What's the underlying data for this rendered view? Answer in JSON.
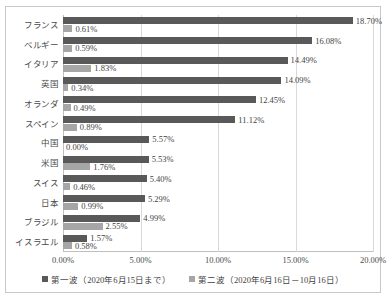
{
  "chart_data": {
    "type": "bar",
    "orientation": "horizontal",
    "title": "",
    "xlabel": "",
    "ylabel": "",
    "xlim": [
      0,
      20
    ],
    "grid": true,
    "legend_position": "bottom",
    "categories": [
      "フランス",
      "ベルギー",
      "イタリア",
      "英国",
      "オランダ",
      "スペイン",
      "中国",
      "米国",
      "スイス",
      "日本",
      "ブラジル",
      "イスラエル"
    ],
    "series": [
      {
        "name": "第一波（2020年6月15日まで）",
        "color": "#595959",
        "values": [
          18.7,
          16.08,
          14.49,
          14.09,
          12.45,
          11.12,
          5.57,
          5.53,
          5.4,
          5.29,
          4.99,
          1.57
        ],
        "labels": [
          "18.70%",
          "16.08%",
          "14.49%",
          "14.09%",
          "12.45%",
          "11.12%",
          "5.57%",
          "5.53%",
          "5.40%",
          "5.29%",
          "4.99%",
          "1.57%"
        ]
      },
      {
        "name": "第二波（2020年6月16日－10月16日）",
        "color": "#a6a6a6",
        "values": [
          0.61,
          0.59,
          1.83,
          0.34,
          0.49,
          0.89,
          0.0,
          1.76,
          0.46,
          0.99,
          2.55,
          0.58
        ],
        "labels": [
          "0.61%",
          "0.59%",
          "1.83%",
          "0.34%",
          "0.49%",
          "0.89%",
          "0.00%",
          "1.76%",
          "0.46%",
          "0.99%",
          "2.55%",
          "0.58%"
        ]
      }
    ],
    "xticks": [
      0,
      5,
      10,
      15,
      20
    ],
    "xticklabels": [
      "0.00%",
      "5.00%",
      "10.00%",
      "15.00%",
      "20.00%"
    ]
  },
  "legend": {
    "entries": [
      {
        "label": "第一波（2020年6月15日まで）"
      },
      {
        "label": "第二波（2020年6月16日－10月16日）"
      }
    ]
  }
}
